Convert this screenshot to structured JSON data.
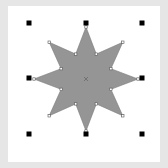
{
  "canvas": {
    "background": "#e6e6e6",
    "page_color": "#ffffff"
  },
  "shape": {
    "type": "8-point star",
    "fill": "#959595",
    "stroke": "#7a7a7a",
    "center": [
      86,
      79
    ],
    "outer_radius": 52,
    "inner_radius": 27,
    "center_marker": "x-marker",
    "selected": true
  },
  "selection_handles": {
    "color": "#000000",
    "positions": [
      [
        29,
        23
      ],
      [
        86,
        23
      ],
      [
        142,
        23
      ],
      [
        29,
        78
      ],
      [
        142,
        78
      ],
      [
        29,
        134
      ],
      [
        86,
        134
      ],
      [
        142,
        134
      ]
    ]
  }
}
